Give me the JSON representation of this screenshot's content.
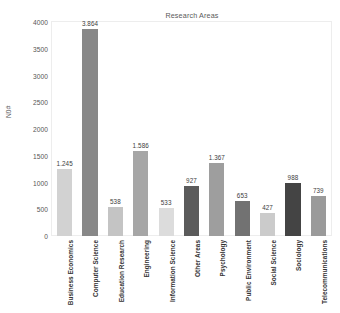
{
  "chart_data": {
    "type": "bar",
    "title": "Research Areas",
    "xlabel": "",
    "ylabel": "N0#",
    "ylim": [
      0,
      4000
    ],
    "yticks": [
      "0",
      "500",
      "1000",
      "1500",
      "2000",
      "2500",
      "3000",
      "3500",
      "4000"
    ],
    "grid": false,
    "legend": "none",
    "categories": [
      "Business Economics",
      "Computer Science",
      "Education Research",
      "Engineering",
      "Information Science",
      "Other Areas",
      "Psychology",
      "Public Environment",
      "Social Science",
      "Sociology",
      "Telecommunications"
    ],
    "values": [
      1245,
      3864,
      538,
      1586,
      533,
      927,
      1367,
      653,
      427,
      988,
      739
    ],
    "value_labels": [
      "1.245",
      "3.864",
      "538",
      "1.586",
      "533",
      "927",
      "1.367",
      "653",
      "427",
      "988",
      "739"
    ],
    "bar_colors": [
      "#d2d2d2",
      "#888888",
      "#c4c4c4",
      "#a6a6a6",
      "#dcdcdc",
      "#5b5b5b",
      "#9e9e9e",
      "#727272",
      "#cbcbcb",
      "#444444",
      "#9a9a9a"
    ]
  }
}
